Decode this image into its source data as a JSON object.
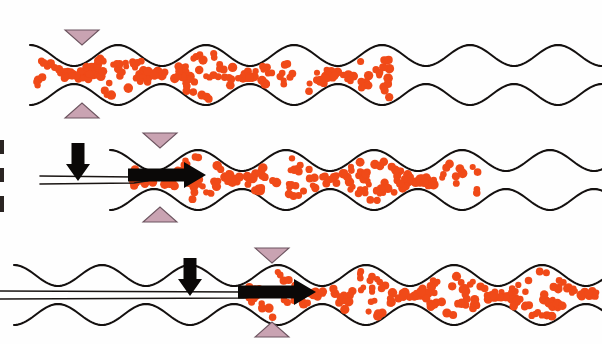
{
  "figure": {
    "panel_count": 3,
    "background_color": "#ffffff"
  },
  "palette": {
    "blood_cell": "#f04a18",
    "vessel_wall": "#14100f",
    "marker_fill": "#c9a3b2",
    "marker_stroke": "#6d5560",
    "arrow": "#0a0807",
    "catheter": "#1a1513"
  },
  "panels": [
    {
      "id": "panel-1",
      "label": "",
      "centerline_y": 75,
      "vessel": {
        "bulge_count": 6,
        "bulge_radius": 30,
        "neck_radius": 9,
        "period": 88,
        "start_x": 30,
        "end_x": 602
      },
      "blood_fill": {
        "present": true,
        "from_x": 34,
        "to_x": 392,
        "cell_count": 150,
        "description": "vessel lumen packed with red blood cells from left end to about two thirds across"
      },
      "markers": [
        {
          "name": "marker-down",
          "x": 82,
          "y": 30,
          "direction": "down"
        },
        {
          "name": "marker-up",
          "x": 82,
          "y": 118,
          "direction": "up"
        }
      ],
      "catheter": {
        "present": false
      },
      "arrows": []
    },
    {
      "id": "panel-2",
      "label": "",
      "centerline_y": 180,
      "vessel": {
        "bulge_count": 6,
        "bulge_radius": 30,
        "neck_radius": 9,
        "period": 88,
        "start_x": 110,
        "end_x": 602
      },
      "blood_fill": {
        "present": true,
        "from_x": 130,
        "to_x": 478,
        "cell_count": 140,
        "description": "blood cells displaced rightward ahead of the catheter tip"
      },
      "markers": [
        {
          "name": "marker-down",
          "x": 160,
          "y": 133,
          "direction": "down"
        },
        {
          "name": "marker-up",
          "x": 160,
          "y": 222,
          "direction": "up"
        }
      ],
      "catheter": {
        "present": true,
        "entry_x": 40,
        "tip_x": 148,
        "description": "thin tapering double-line catheter entering from the left margin"
      },
      "arrows": [
        {
          "name": "pressure-arrow-down",
          "type": "down",
          "x": 78,
          "y_top": 143,
          "length": 38
        },
        {
          "name": "flow-arrow-right",
          "type": "right",
          "x_start": 128,
          "y": 175,
          "length": 78
        }
      ]
    },
    {
      "id": "panel-3",
      "label": "",
      "centerline_y": 295,
      "vessel": {
        "bulge_count": 6,
        "bulge_radius": 30,
        "neck_radius": 9,
        "period": 88,
        "start_x": 14,
        "end_x": 602
      },
      "blood_fill": {
        "present": true,
        "from_x": 238,
        "to_x": 596,
        "cell_count": 145,
        "description": "first bulge now cleared of blood; cells pushed further downstream"
      },
      "markers": [
        {
          "name": "marker-down",
          "x": 272,
          "y": 248,
          "direction": "down"
        },
        {
          "name": "marker-up",
          "x": 272,
          "y": 337,
          "direction": "up"
        }
      ],
      "catheter": {
        "present": true,
        "entry_x": 0,
        "tip_x": 258,
        "description": "catheter advanced deeper, tip past the first bulge"
      },
      "arrows": [
        {
          "name": "pressure-arrow-down",
          "type": "down",
          "x": 190,
          "y_top": 258,
          "length": 38
        },
        {
          "name": "flow-arrow-right",
          "type": "right",
          "x_start": 238,
          "y": 292,
          "length": 78
        }
      ]
    }
  ],
  "edge_marks": [
    {
      "name": "edge-mark-1",
      "x": 0,
      "y": 140,
      "w": 4,
      "h": 14
    },
    {
      "name": "edge-mark-2",
      "x": 0,
      "y": 168,
      "w": 4,
      "h": 14
    },
    {
      "name": "edge-mark-3",
      "x": 0,
      "y": 196,
      "w": 4,
      "h": 16
    }
  ]
}
